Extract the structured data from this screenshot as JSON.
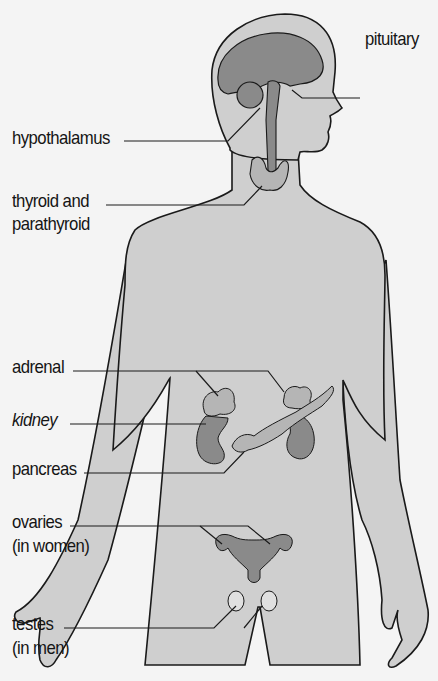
{
  "diagram": {
    "type": "anatomical-figure",
    "colors": {
      "background": "#f4f4f4",
      "body_fill": "#cfcfcf",
      "organ_fill": "#8a8a8a",
      "gland_fill": "#b5b5b5",
      "outline": "#1a1a1a"
    },
    "labels": {
      "pituitary": "pituitary",
      "hypothalamus": "hypothalamus",
      "thyroid_line1": "thyroid and",
      "thyroid_line2": "parathyroid",
      "adrenal": "adrenal",
      "kidney": "kidney",
      "pancreas": "pancreas",
      "ovaries_line1": "ovaries",
      "ovaries_line2": "(in women)",
      "testes_line1": "testes",
      "testes_line2": "(in men)"
    }
  }
}
